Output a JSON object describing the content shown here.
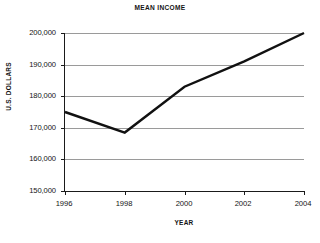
{
  "chart_data": {
    "type": "line",
    "title": "MEAN INCOME",
    "xlabel": "YEAR",
    "ylabel": "U.S. DOLLARS",
    "x": [
      1996,
      1998,
      2000,
      2002,
      2004
    ],
    "xtick_labels": [
      "1996",
      "1998",
      "2000",
      "2002",
      "2004"
    ],
    "values": [
      175000,
      168500,
      183000,
      191000,
      200000
    ],
    "ytick_values": [
      150000,
      160000,
      170000,
      180000,
      190000,
      200000
    ],
    "ytick_labels": [
      "150,000",
      "160,000",
      "170,000",
      "180,000",
      "190,000",
      "200,000"
    ],
    "xlim": [
      1996,
      2004
    ],
    "ylim": [
      150000,
      200000
    ],
    "grid": "horizontal",
    "legend": "none",
    "series_color": "#111111",
    "gridline_color": "#9a9a9a",
    "axis_color": "#1a1a1a",
    "background_color": "#ffffff"
  }
}
